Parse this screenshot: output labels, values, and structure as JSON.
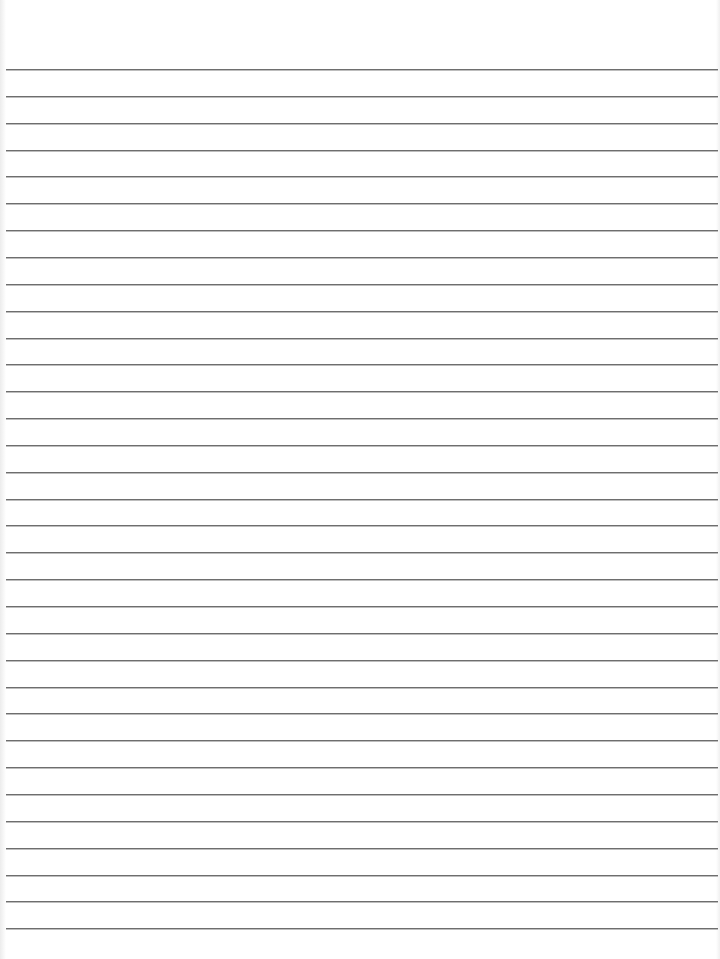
{
  "paper": {
    "type": "lined-paper",
    "background": "#ffffff",
    "rule_color": "#6e6e6e",
    "rule_count": 33,
    "first_rule_y": 69,
    "rule_spacing": 26.85
  }
}
